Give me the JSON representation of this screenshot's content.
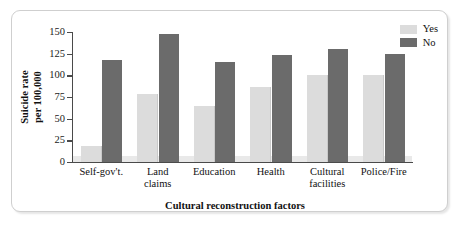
{
  "chart_data": {
    "type": "bar",
    "title": "",
    "xlabel": "Cultural reconstruction factors",
    "ylabel": "Suicide rate\nper 100,000",
    "ylabel_line1": "Suicide rate",
    "ylabel_line2": "per 100,000",
    "categories": [
      "Self-gov't.",
      "Land claims",
      "Education",
      "Health",
      "Cultural facilities",
      "Police/Fire"
    ],
    "category_lines": [
      [
        "Self-gov't."
      ],
      [
        "Land",
        "claims"
      ],
      [
        "Education"
      ],
      [
        "Health"
      ],
      [
        "Cultural",
        "facilities"
      ],
      [
        "Police/Fire"
      ]
    ],
    "series": [
      {
        "name": "Yes",
        "color": "#dcdcdc",
        "values": [
          18,
          78,
          65,
          86,
          100,
          100
        ]
      },
      {
        "name": "No",
        "color": "#6b6b6b",
        "values": [
          118,
          148,
          115,
          124,
          130,
          125
        ]
      }
    ],
    "ylim": [
      0,
      150
    ],
    "yticks": [
      0,
      25,
      50,
      75,
      100,
      125,
      150
    ],
    "ytick_labels": [
      "0",
      "25",
      "50",
      "75",
      "100",
      "125",
      "150"
    ],
    "grid": false,
    "legend_position": "top-right",
    "frame_color": "#cfcfcf",
    "axis_color": "#4a4a4a"
  },
  "legend": {
    "items": [
      {
        "label": "Yes"
      },
      {
        "label": "No"
      }
    ]
  }
}
